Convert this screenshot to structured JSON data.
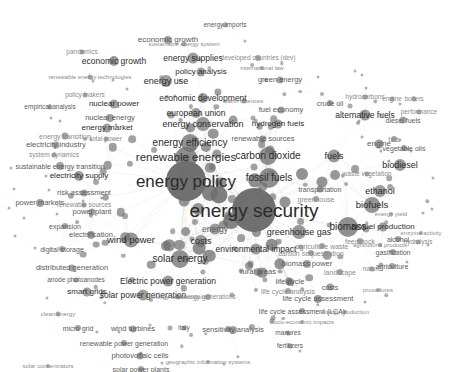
{
  "visualization": {
    "kind": "bibliometric-co-occurrence-network",
    "title": "",
    "width": 470,
    "height": 372,
    "background_color": "#ffffff",
    "node_color": "#6e6e6e",
    "edge_color": "#b9b9b9",
    "label_color": "#2b2b2b"
  },
  "chart_data": {
    "type": "scatter",
    "title": "",
    "xlabel": "",
    "ylabel": "",
    "grid": false,
    "legend": "none",
    "nodes": [
      {
        "label": "energy security",
        "x": 254,
        "y": 210,
        "size": 44,
        "font": 19,
        "tone": "dark"
      },
      {
        "label": "energy policy",
        "x": 186,
        "y": 181,
        "size": 40,
        "font": 17,
        "tone": "dark"
      },
      {
        "label": "renewable energies",
        "x": 186,
        "y": 158,
        "size": 22,
        "font": 11.5,
        "tone": "dark"
      },
      {
        "label": "energy efficiency",
        "x": 190,
        "y": 143,
        "size": 18,
        "font": 10,
        "tone": "dark"
      },
      {
        "label": "fossil fuels",
        "x": 269,
        "y": 178,
        "size": 20,
        "font": 10,
        "tone": "dark"
      },
      {
        "label": "carbon dioxide",
        "x": 268,
        "y": 156,
        "size": 18,
        "font": 10,
        "tone": "dark"
      },
      {
        "label": "energy conservation",
        "x": 203,
        "y": 124,
        "size": 14,
        "font": 9,
        "tone": "dark"
      },
      {
        "label": "biomass",
        "x": 348,
        "y": 227,
        "size": 20,
        "font": 10,
        "tone": "dark"
      },
      {
        "label": "greenhouse gas",
        "x": 299,
        "y": 232,
        "size": 14,
        "font": 9,
        "tone": "dark"
      },
      {
        "label": "solar energy",
        "x": 180,
        "y": 259,
        "size": 18,
        "font": 10,
        "tone": "dark"
      },
      {
        "label": "wind power",
        "x": 131,
        "y": 240,
        "size": 15,
        "font": 9.5,
        "tone": "dark"
      },
      {
        "label": "costs",
        "x": 201,
        "y": 241,
        "size": 12,
        "font": 9,
        "tone": "dark"
      },
      {
        "label": "energy",
        "x": 215,
        "y": 229,
        "size": 11,
        "font": 8.5,
        "tone": "mid"
      },
      {
        "label": "biofuels",
        "x": 372,
        "y": 205,
        "size": 16,
        "font": 9.5,
        "tone": "dark"
      },
      {
        "label": "ethanol",
        "x": 380,
        "y": 191,
        "size": 12,
        "font": 9,
        "tone": "dark"
      },
      {
        "label": "biodiesel",
        "x": 400,
        "y": 165,
        "size": 12,
        "font": 9,
        "tone": "dark"
      },
      {
        "label": "fuels",
        "x": 334,
        "y": 156,
        "size": 13,
        "font": 9,
        "tone": "dark"
      },
      {
        "label": "engine",
        "x": 379,
        "y": 144,
        "size": 9,
        "font": 8,
        "tone": "mid"
      },
      {
        "label": "alternative fuels",
        "x": 365,
        "y": 115,
        "size": 11,
        "font": 8.5,
        "tone": "dark"
      },
      {
        "label": "environmental impact",
        "x": 256,
        "y": 249,
        "size": 11,
        "font": 8.5,
        "tone": "dark"
      },
      {
        "label": "Electric power generation",
        "x": 168,
        "y": 281,
        "size": 11,
        "font": 8.5,
        "tone": "dark"
      },
      {
        "label": "solar power generation",
        "x": 143,
        "y": 295,
        "size": 11,
        "font": 8.5,
        "tone": "dark"
      },
      {
        "label": "biofuel production",
        "x": 383,
        "y": 227,
        "size": 9,
        "font": 8,
        "tone": "dark"
      },
      {
        "label": "european union",
        "x": 196,
        "y": 113,
        "size": 10,
        "font": 8.5,
        "tone": "dark"
      },
      {
        "label": "economic development",
        "x": 203,
        "y": 98,
        "size": 10,
        "font": 8.5,
        "tone": "dark"
      },
      {
        "label": "energy use",
        "x": 166,
        "y": 81,
        "size": 12,
        "font": 9,
        "tone": "dark"
      },
      {
        "label": "energy supplies",
        "x": 193,
        "y": 58,
        "size": 11,
        "font": 8.5,
        "tone": "dark"
      },
      {
        "label": "economic growth",
        "x": 114,
        "y": 61,
        "size": 10,
        "font": 8.5,
        "tone": "dark"
      },
      {
        "label": "economic growth",
        "x": 168,
        "y": 40,
        "size": 8,
        "font": 8,
        "tone": "mid"
      },
      {
        "label": "policy analysis",
        "x": 201,
        "y": 72,
        "size": 9,
        "font": 8,
        "tone": "dark"
      },
      {
        "label": "energy imports",
        "x": 225,
        "y": 25,
        "size": 5,
        "font": 6.5,
        "tone": "mid"
      },
      {
        "label": "green energy",
        "x": 280,
        "y": 80,
        "size": 7,
        "font": 7.5,
        "tone": "mid"
      },
      {
        "label": "developed countries (dev)",
        "x": 258,
        "y": 58,
        "size": 6,
        "font": 6.5,
        "tone": "faint"
      },
      {
        "label": "international law",
        "x": 262,
        "y": 68,
        "size": 4,
        "font": 6,
        "tone": "faint"
      },
      {
        "label": "sustainable energy system",
        "x": 184,
        "y": 44,
        "size": 5,
        "font": 6,
        "tone": "faint"
      },
      {
        "label": "hydrogen fuels",
        "x": 278,
        "y": 124,
        "size": 9,
        "font": 8,
        "tone": "dark"
      },
      {
        "label": "fuel economy",
        "x": 281,
        "y": 110,
        "size": 7,
        "font": 7.5,
        "tone": "mid"
      },
      {
        "label": "renewable sources",
        "x": 263,
        "y": 139,
        "size": 7,
        "font": 7.5,
        "tone": "mid"
      },
      {
        "label": "nuclear power",
        "x": 114,
        "y": 104,
        "size": 9,
        "font": 8,
        "tone": "dark"
      },
      {
        "label": "nuclear energy",
        "x": 110,
        "y": 118,
        "size": 8,
        "font": 7.5,
        "tone": "mid"
      },
      {
        "label": "energy market",
        "x": 107,
        "y": 128,
        "size": 9,
        "font": 8,
        "tone": "dark"
      },
      {
        "label": "electricity industry",
        "x": 56,
        "y": 145,
        "size": 7,
        "font": 7.5,
        "tone": "mid"
      },
      {
        "label": "energy transition",
        "x": 65,
        "y": 136,
        "size": 7,
        "font": 7,
        "tone": "faint"
      },
      {
        "label": "total power",
        "x": 106,
        "y": 139,
        "size": 5,
        "font": 6.5,
        "tone": "faint"
      },
      {
        "label": "system dynamics",
        "x": 54,
        "y": 155,
        "size": 5,
        "font": 6.5,
        "tone": "faint"
      },
      {
        "label": "sustainable energy transition",
        "x": 60,
        "y": 166,
        "size": 8,
        "font": 7,
        "tone": "mid"
      },
      {
        "label": "electricity supply",
        "x": 79,
        "y": 176,
        "size": 10,
        "font": 8,
        "tone": "dark"
      },
      {
        "label": "risk assessment",
        "x": 84,
        "y": 193,
        "size": 7,
        "font": 7.5,
        "tone": "mid"
      },
      {
        "label": "power markets",
        "x": 40,
        "y": 203,
        "size": 8,
        "font": 7.5,
        "tone": "mid"
      },
      {
        "label": "renewable sources",
        "x": 84,
        "y": 205,
        "size": 5,
        "font": 6.5,
        "tone": "faint"
      },
      {
        "label": "power plant",
        "x": 92,
        "y": 212,
        "size": 7,
        "font": 7.5,
        "tone": "mid"
      },
      {
        "label": "expansion",
        "x": 65,
        "y": 226,
        "size": 6,
        "font": 7,
        "tone": "mid"
      },
      {
        "label": "electrification",
        "x": 91,
        "y": 235,
        "size": 8,
        "font": 7.5,
        "tone": "mid"
      },
      {
        "label": "digital storage",
        "x": 62,
        "y": 249,
        "size": 6,
        "font": 7,
        "tone": "mid"
      },
      {
        "label": "distributed generation",
        "x": 72,
        "y": 268,
        "size": 7,
        "font": 7.5,
        "tone": "mid"
      },
      {
        "label": "smart grids",
        "x": 87,
        "y": 292,
        "size": 9,
        "font": 8,
        "tone": "dark"
      },
      {
        "label": "micro grid",
        "x": 78,
        "y": 328,
        "size": 6,
        "font": 7,
        "tone": "mid"
      },
      {
        "label": "wind turbines",
        "x": 133,
        "y": 329,
        "size": 7,
        "font": 7.5,
        "tone": "mid"
      },
      {
        "label": "italy",
        "x": 184,
        "y": 328,
        "size": 5,
        "font": 6.5,
        "tone": "mid"
      },
      {
        "label": "sensitivity analysis",
        "x": 233,
        "y": 330,
        "size": 8,
        "font": 7.5,
        "tone": "mid"
      },
      {
        "label": "renewable power generation",
        "x": 124,
        "y": 343,
        "size": 6,
        "font": 7,
        "tone": "mid"
      },
      {
        "label": "photovoltaic cells",
        "x": 140,
        "y": 356,
        "size": 7,
        "font": 7.5,
        "tone": "mid"
      },
      {
        "label": "solar power plants",
        "x": 141,
        "y": 369,
        "size": 6,
        "font": 7,
        "tone": "mid"
      },
      {
        "label": "solar concentrators",
        "x": 48,
        "y": 366,
        "size": 4,
        "font": 6,
        "tone": "faint"
      },
      {
        "label": "geographic information systems",
        "x": 208,
        "y": 362,
        "size": 4,
        "font": 6,
        "tone": "faint"
      },
      {
        "label": "energy generations",
        "x": 208,
        "y": 297,
        "size": 6,
        "font": 6.5,
        "tone": "faint"
      },
      {
        "label": "rural areas",
        "x": 258,
        "y": 272,
        "size": 8,
        "font": 7.5,
        "tone": "mid"
      },
      {
        "label": "biomass power",
        "x": 307,
        "y": 264,
        "size": 8,
        "font": 7.5,
        "tone": "mid"
      },
      {
        "label": "agriculture waste",
        "x": 322,
        "y": 246,
        "size": 6,
        "font": 7,
        "tone": "faint"
      },
      {
        "label": "carbon sequestration",
        "x": 311,
        "y": 253,
        "size": 6,
        "font": 7,
        "tone": "faint"
      },
      {
        "label": "life cycle",
        "x": 290,
        "y": 282,
        "size": 8,
        "font": 7.5,
        "tone": "mid"
      },
      {
        "label": "life cycle analysis",
        "x": 288,
        "y": 291,
        "size": 6,
        "font": 7,
        "tone": "faint"
      },
      {
        "label": "life cycle assessment",
        "x": 318,
        "y": 299,
        "size": 8,
        "font": 7.5,
        "tone": "mid"
      },
      {
        "label": "life cycle assessment (LCA)",
        "x": 302,
        "y": 311,
        "size": 6,
        "font": 7,
        "tone": "mid"
      },
      {
        "label": "energy production",
        "x": 345,
        "y": 312,
        "size": 4,
        "font": 6,
        "tone": "faint"
      },
      {
        "label": "socio-economic impacts",
        "x": 302,
        "y": 322,
        "size": 4,
        "font": 6,
        "tone": "faint"
      },
      {
        "label": "manures",
        "x": 288,
        "y": 333,
        "size": 5,
        "font": 6.5,
        "tone": "mid"
      },
      {
        "label": "fertilizers",
        "x": 290,
        "y": 346,
        "size": 5,
        "font": 6.5,
        "tone": "mid"
      },
      {
        "label": "costs",
        "x": 330,
        "y": 287,
        "size": 7,
        "font": 7,
        "tone": "mid"
      },
      {
        "label": "procedures",
        "x": 378,
        "y": 290,
        "size": 4,
        "font": 6,
        "tone": "faint"
      },
      {
        "label": "landscape",
        "x": 340,
        "y": 272,
        "size": 6,
        "font": 7,
        "tone": "faint"
      },
      {
        "label": "agriculture",
        "x": 392,
        "y": 266,
        "size": 6,
        "font": 7,
        "tone": "mid"
      },
      {
        "label": "nature",
        "x": 372,
        "y": 269,
        "size": 5,
        "font": 6.5,
        "tone": "faint"
      },
      {
        "label": "gasification",
        "x": 393,
        "y": 252,
        "size": 6,
        "font": 7,
        "tone": "mid"
      },
      {
        "label": "hydrolysis",
        "x": 418,
        "y": 242,
        "size": 5,
        "font": 6.5,
        "tone": "faint"
      },
      {
        "label": "enzyme activity",
        "x": 421,
        "y": 233,
        "size": 4,
        "font": 6,
        "tone": "faint"
      },
      {
        "label": "alcohol",
        "x": 398,
        "y": 239,
        "size": 6,
        "font": 7,
        "tone": "mid"
      },
      {
        "label": "feedstock",
        "x": 360,
        "y": 241,
        "size": 6,
        "font": 7,
        "tone": "faint"
      },
      {
        "label": "agricultural products",
        "x": 380,
        "y": 245,
        "size": 4,
        "font": 6,
        "tone": "faint"
      },
      {
        "label": "energy yield",
        "x": 391,
        "y": 214,
        "size": 4,
        "font": 6,
        "tone": "faint"
      },
      {
        "label": "transportation",
        "x": 320,
        "y": 189,
        "size": 7,
        "font": 7,
        "tone": "mid"
      },
      {
        "label": "greenhouse",
        "x": 316,
        "y": 199,
        "size": 6,
        "font": 7,
        "tone": "faint"
      },
      {
        "label": "waste vegetation",
        "x": 367,
        "y": 174,
        "size": 5,
        "font": 6.5,
        "tone": "faint"
      },
      {
        "label": "vegetable oils",
        "x": 404,
        "y": 148,
        "size": 6,
        "font": 7,
        "tone": "mid"
      },
      {
        "label": "fats",
        "x": 394,
        "y": 139,
        "size": 6,
        "font": 7,
        "tone": "faint"
      },
      {
        "label": "diesel fuels",
        "x": 403,
        "y": 120,
        "size": 7,
        "font": 7,
        "tone": "mid"
      },
      {
        "label": "performance",
        "x": 419,
        "y": 112,
        "size": 5,
        "font": 6.5,
        "tone": "faint"
      },
      {
        "label": "crude oil",
        "x": 330,
        "y": 103,
        "size": 6,
        "font": 7,
        "tone": "mid"
      },
      {
        "label": "hydrocarbons",
        "x": 365,
        "y": 97,
        "size": 5,
        "font": 6.5,
        "tone": "faint"
      },
      {
        "label": "engine",
        "x": 392,
        "y": 99,
        "size": 5,
        "font": 6.5,
        "tone": "faint"
      },
      {
        "label": "boilers",
        "x": 414,
        "y": 99,
        "size": 5,
        "font": 6.5,
        "tone": "faint"
      },
      {
        "label": "empirical analysis",
        "x": 50,
        "y": 107,
        "size": 5,
        "font": 6.5,
        "tone": "mid"
      },
      {
        "label": "policy makers",
        "x": 85,
        "y": 95,
        "size": 5,
        "font": 6.5,
        "tone": "faint"
      },
      {
        "label": "renewable energy technologies",
        "x": 90,
        "y": 77,
        "size": 5,
        "font": 6,
        "tone": "faint"
      },
      {
        "label": "pandemics",
        "x": 82,
        "y": 52,
        "size": 5,
        "font": 6.5,
        "tone": "faint"
      },
      {
        "label": "earth sciences",
        "x": 244,
        "y": 101,
        "size": 5,
        "font": 6,
        "tone": "faint"
      },
      {
        "label": "energy conservation",
        "x": 178,
        "y": 297,
        "size": 5,
        "font": 6,
        "tone": "faint"
      },
      {
        "label": "clean energy",
        "x": 58,
        "y": 314,
        "size": 5,
        "font": 6,
        "tone": "faint"
      },
      {
        "label": "anode photoanodes",
        "x": 76,
        "y": 280,
        "size": 5,
        "font": 6.5,
        "tone": "mid"
      }
    ],
    "node_count_approx": 210,
    "edges_note": "dense light-gray straight edges between nodes, strongest around the central cluster"
  }
}
